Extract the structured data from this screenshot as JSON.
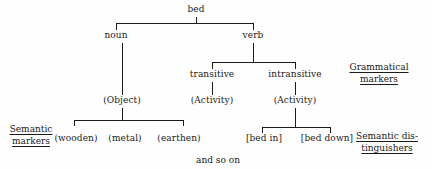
{
  "diagram": {
    "title_node": "bed",
    "nodes": {
      "root": "bed",
      "noun": "noun",
      "verb": "verb",
      "transitive": "transitive",
      "intransitive": "intransitive",
      "object": "(Object)",
      "activity_transitive": "(Activity)",
      "activity_intransitive": "(Activity)",
      "wooden": "(wooden)",
      "metal": "(metal)",
      "earthen": "(earthen)",
      "bed_in": "[bed in]",
      "bed_down": "[bed down]"
    },
    "markers": {
      "semantic_markers_line1": "Semantic",
      "semantic_markers_line2": "markers",
      "grammatical_markers_line1": "Grammatical",
      "grammatical_markers_line2": "markers",
      "semantic_distinguishers_line1": "Semantic dis-",
      "semantic_distinguishers_line2": "tinguishers"
    },
    "footer": "and so on",
    "colors": {
      "ink": "#1b1b1b",
      "background": "#fefefe"
    }
  }
}
